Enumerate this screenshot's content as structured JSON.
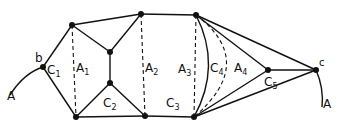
{
  "diagram": {
    "type": "graph-decomposition",
    "ink_color": "#111111",
    "background": "#ffffff",
    "nodes": [
      {
        "id": "b",
        "x": 43,
        "y": 67,
        "label": "b"
      },
      {
        "id": "n1",
        "x": 72,
        "y": 25
      },
      {
        "id": "n2",
        "x": 76,
        "y": 117
      },
      {
        "id": "n3",
        "x": 110,
        "y": 52
      },
      {
        "id": "n4",
        "x": 110,
        "y": 83
      },
      {
        "id": "n5",
        "x": 141,
        "y": 14
      },
      {
        "id": "n6",
        "x": 145,
        "y": 116
      },
      {
        "id": "n7",
        "x": 196,
        "y": 15
      },
      {
        "id": "n8",
        "x": 194,
        "y": 117
      },
      {
        "id": "n9",
        "x": 268,
        "y": 70
      },
      {
        "id": "c",
        "x": 316,
        "y": 70,
        "label": "c"
      }
    ],
    "labels": {
      "curve_left": {
        "main": "A",
        "sub": ""
      },
      "curve_right": {
        "main": "A",
        "sub": ""
      },
      "b": "b",
      "c": "c",
      "C1": {
        "main": "C",
        "sub": "1"
      },
      "A1": {
        "main": "A",
        "sub": "1"
      },
      "A2": {
        "main": "A",
        "sub": "2"
      },
      "C2": {
        "main": "C",
        "sub": "2"
      },
      "C3": {
        "main": "C",
        "sub": "3"
      },
      "A3": {
        "main": "A",
        "sub": "3"
      },
      "C4": {
        "main": "C",
        "sub": "4"
      },
      "A4": {
        "main": "A",
        "sub": "4"
      },
      "C5": {
        "main": "C",
        "sub": "5"
      }
    }
  }
}
